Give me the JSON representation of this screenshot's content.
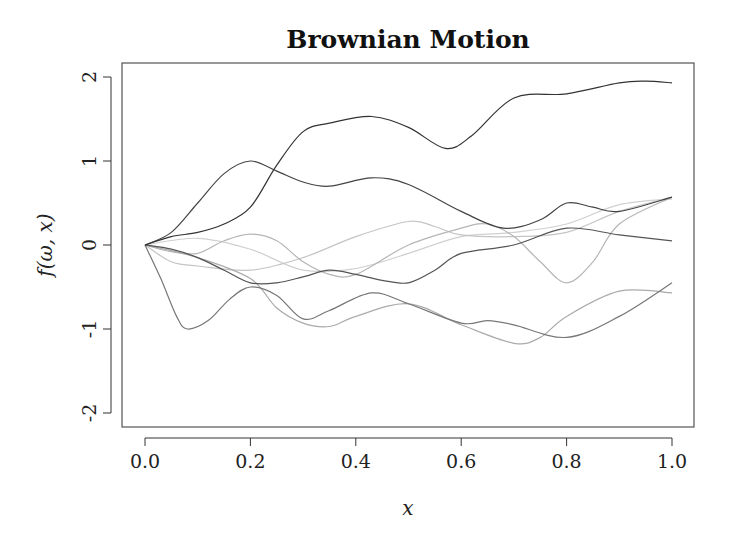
{
  "chart_data": {
    "type": "line",
    "title": "Brownian Motion",
    "xlabel": "x",
    "ylabel": "f(ω, x)",
    "xlim": [
      0,
      1
    ],
    "ylim": [
      -2,
      2
    ],
    "grid": false,
    "legend": null,
    "x_ticks": [
      "0.0",
      "0.2",
      "0.4",
      "0.6",
      "0.8",
      "1.0"
    ],
    "y_ticks": [
      "-2",
      "-1",
      "0",
      "1",
      "2"
    ],
    "series": [
      {
        "name": "path-1",
        "color": "#333333",
        "x": [
          0,
          0.05,
          0.1,
          0.15,
          0.2,
          0.25,
          0.3,
          0.35,
          0.43,
          0.5,
          0.57,
          0.62,
          0.7,
          0.8,
          0.9,
          0.95,
          1.0
        ],
        "y": [
          0,
          0.1,
          0.15,
          0.25,
          0.45,
          0.95,
          1.35,
          1.45,
          1.53,
          1.4,
          1.15,
          1.3,
          1.75,
          1.8,
          1.93,
          1.95,
          1.93
        ]
      },
      {
        "name": "path-2",
        "color": "#444444",
        "x": [
          0,
          0.05,
          0.1,
          0.15,
          0.2,
          0.25,
          0.3,
          0.35,
          0.43,
          0.5,
          0.6,
          0.68,
          0.75,
          0.8,
          0.85,
          0.9,
          1.0
        ],
        "y": [
          0,
          0.15,
          0.5,
          0.85,
          1.0,
          0.88,
          0.75,
          0.7,
          0.8,
          0.72,
          0.4,
          0.2,
          0.3,
          0.5,
          0.45,
          0.4,
          0.57
        ]
      },
      {
        "name": "path-3",
        "color": "#555555",
        "x": [
          0,
          0.05,
          0.1,
          0.15,
          0.2,
          0.25,
          0.3,
          0.35,
          0.4,
          0.45,
          0.5,
          0.55,
          0.6,
          0.7,
          0.8,
          0.9,
          1.0
        ],
        "y": [
          0,
          -0.05,
          -0.15,
          -0.3,
          -0.45,
          -0.45,
          -0.38,
          -0.3,
          -0.35,
          -0.42,
          -0.45,
          -0.3,
          -0.1,
          0.0,
          0.2,
          0.12,
          0.05
        ]
      },
      {
        "name": "path-4",
        "color": "#777777",
        "x": [
          0,
          0.03,
          0.06,
          0.08,
          0.12,
          0.16,
          0.2,
          0.25,
          0.3,
          0.35,
          0.43,
          0.5,
          0.6,
          0.65,
          0.7,
          0.8,
          0.9,
          1.0
        ],
        "y": [
          0,
          -0.4,
          -0.85,
          -1.0,
          -0.9,
          -0.65,
          -0.5,
          -0.6,
          -0.88,
          -0.78,
          -0.57,
          -0.7,
          -0.93,
          -0.9,
          -0.95,
          -1.1,
          -0.85,
          -0.45
        ]
      },
      {
        "name": "path-5",
        "color": "#aaaaaa",
        "x": [
          0,
          0.1,
          0.2,
          0.25,
          0.3,
          0.35,
          0.4,
          0.5,
          0.6,
          0.7,
          0.75,
          0.8,
          0.9,
          1.0
        ],
        "y": [
          0,
          -0.15,
          -0.4,
          -0.75,
          -0.93,
          -0.97,
          -0.85,
          -0.7,
          -0.95,
          -1.17,
          -1.1,
          -0.85,
          -0.55,
          -0.57
        ]
      },
      {
        "name": "path-6",
        "color": "#b5b5b5",
        "x": [
          0,
          0.05,
          0.1,
          0.15,
          0.2,
          0.25,
          0.3,
          0.35,
          0.4,
          0.5,
          0.6,
          0.65,
          0.7,
          0.75,
          0.8,
          0.85,
          0.9,
          1.0
        ],
        "y": [
          0,
          -0.08,
          -0.1,
          0.05,
          0.13,
          0.05,
          -0.2,
          -0.35,
          -0.35,
          0.0,
          0.2,
          0.25,
          0.1,
          -0.2,
          -0.45,
          -0.2,
          0.25,
          0.57
        ]
      },
      {
        "name": "path-7",
        "color": "#c4c4c4",
        "x": [
          0,
          0.05,
          0.1,
          0.2,
          0.3,
          0.4,
          0.5,
          0.55,
          0.6,
          0.7,
          0.8,
          0.9,
          1.0
        ],
        "y": [
          0,
          -0.2,
          -0.25,
          -0.3,
          -0.15,
          0.1,
          0.28,
          0.22,
          0.12,
          0.1,
          0.15,
          0.4,
          0.57
        ]
      },
      {
        "name": "path-8",
        "color": "#d0d0d0",
        "x": [
          0,
          0.1,
          0.2,
          0.3,
          0.4,
          0.5,
          0.6,
          0.7,
          0.8,
          0.9,
          1.0
        ],
        "y": [
          0,
          0.08,
          -0.05,
          -0.3,
          -0.28,
          -0.1,
          0.1,
          0.15,
          0.25,
          0.48,
          0.55
        ]
      }
    ]
  },
  "plot": {
    "title": "Brownian Motion",
    "xlabel": "x",
    "ylabel": "f(ω, x)",
    "x_ticks": [
      "0.0",
      "0.2",
      "0.4",
      "0.6",
      "0.8",
      "1.0"
    ],
    "y_ticks": [
      "-2",
      "-1",
      "0",
      "1",
      "2"
    ]
  }
}
